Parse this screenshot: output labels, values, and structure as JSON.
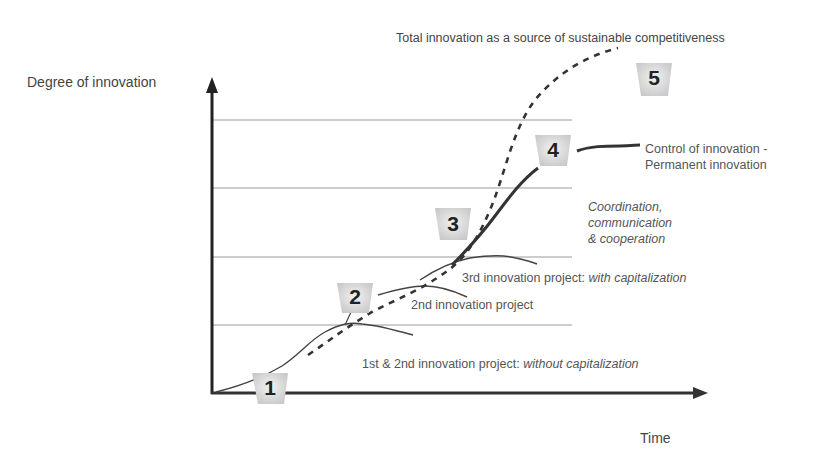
{
  "diagram": {
    "y_axis_label": "Degree of innovation",
    "x_axis_label": "Time",
    "top_annotation": "Total innovation as a source of sustainable competitiveness",
    "stage4_label_line1": "Control of innovation -",
    "stage4_label_line2": "Permanent innovation",
    "coordination_line1": "Coordination,",
    "coordination_line2": "communication",
    "coordination_line3": "& cooperation",
    "project3_label_plain": "3rd innovation project: ",
    "project3_label_italic": "with capitalization",
    "project2_label": "2nd innovation project",
    "project1_label_plain": "1st & 2nd innovation project: ",
    "project1_label_italic": "without capitalization",
    "stages": [
      {
        "number": "1"
      },
      {
        "number": "2"
      },
      {
        "number": "3"
      },
      {
        "number": "4"
      },
      {
        "number": "5"
      }
    ],
    "colors": {
      "axis": "#222222",
      "gridline": "#9a9a9a",
      "curve": "#333333",
      "badge_fill": "#d8d8d8",
      "text": "#555555"
    }
  }
}
